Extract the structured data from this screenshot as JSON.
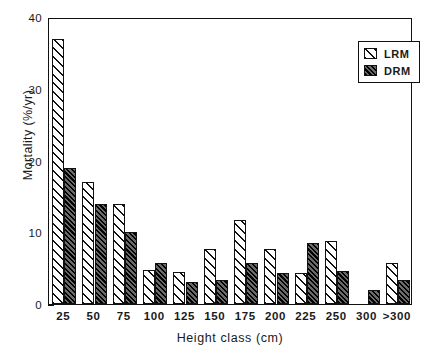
{
  "chart_data": {
    "type": "bar",
    "title": "",
    "xlabel": "Height class (cm)",
    "ylabel": "Mortality (%/yr)",
    "categories": [
      "25",
      "50",
      "75",
      "100",
      "125",
      "150",
      "175",
      "200",
      "225",
      "250",
      "300",
      ">300"
    ],
    "series": [
      {
        "name": "LRM",
        "values": [
          37.0,
          17.0,
          14.0,
          4.8,
          4.4,
          7.6,
          11.7,
          7.7,
          4.3,
          8.8,
          0.0,
          5.7
        ]
      },
      {
        "name": "DRM",
        "values": [
          18.9,
          14.0,
          10.0,
          5.7,
          3.0,
          3.4,
          5.7,
          4.3,
          8.5,
          4.6,
          2.0,
          3.3
        ]
      }
    ],
    "ylim": [
      0,
      40
    ],
    "yticks": [
      0,
      10,
      20,
      30,
      40
    ],
    "ytick_labels": [
      "0",
      "10",
      "20",
      "30",
      "40"
    ],
    "grid": false,
    "legend_position": "top-right",
    "colors": {
      "lrm_fill": "#ffffff",
      "lrm_hatch": "#111111",
      "drm_fill": "#2b2b2b",
      "drm_hatch": "#000000",
      "axis": "#111111"
    }
  },
  "legend": {
    "entries": [
      {
        "label": "LRM",
        "pattern": "light-diagonal-hatch"
      },
      {
        "label": "DRM",
        "pattern": "dark-diagonal-hatch"
      }
    ]
  }
}
